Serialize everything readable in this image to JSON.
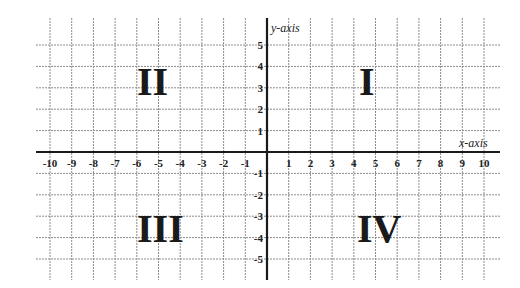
{
  "chart_data": {
    "type": "cartesian-plane",
    "title": "",
    "xlabel": "x-axis",
    "ylabel": "y-axis",
    "xlim": [
      -10,
      10
    ],
    "ylim": [
      -5,
      5
    ],
    "grid": true,
    "x_ticks": [
      -10,
      -9,
      -8,
      -7,
      -6,
      -5,
      -4,
      -3,
      -2,
      -1,
      1,
      2,
      3,
      4,
      5,
      6,
      7,
      8,
      9,
      10
    ],
    "y_ticks": [
      5,
      4,
      3,
      2,
      1,
      -1,
      -2,
      -3,
      -4,
      -5
    ],
    "quadrants": [
      {
        "label": "I",
        "x": 4.7,
        "y": 3
      },
      {
        "label": "II",
        "x": -5.1,
        "y": 3
      },
      {
        "label": "III",
        "x": -4.6,
        "y": -3
      },
      {
        "label": "IV",
        "x": 5.1,
        "y": -3
      }
    ]
  },
  "labels": {
    "x_axis_title": "x-axis",
    "y_axis_title": "y-axis",
    "quadrant_1": "I",
    "quadrant_2": "II",
    "quadrant_3": "III",
    "quadrant_4": "IV"
  },
  "colors": {
    "grid": "#8c8c8c",
    "axis": "#1a1a1a",
    "text": "#222222"
  }
}
